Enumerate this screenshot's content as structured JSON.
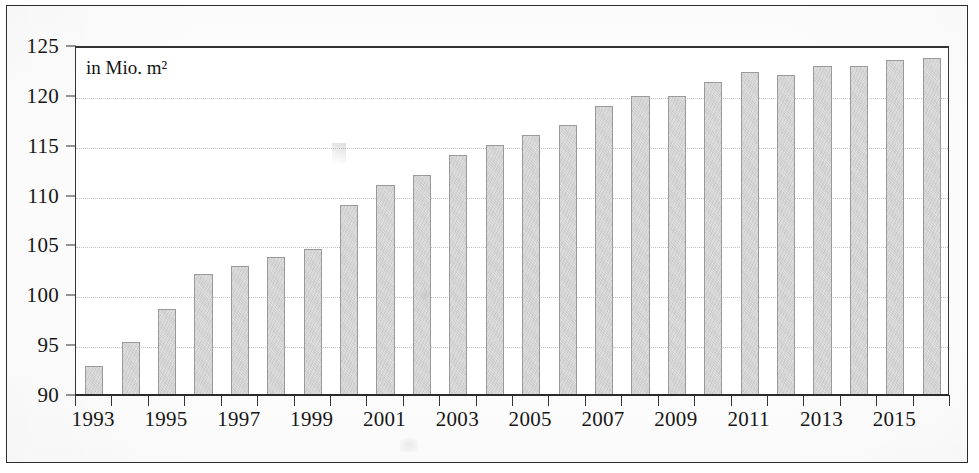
{
  "chart_data": {
    "type": "bar",
    "title": "",
    "subtitle": "",
    "unit_annotation": "in Mio. m²",
    "xlabel": "",
    "ylabel": "",
    "ylim": [
      90,
      125
    ],
    "y_ticks": [
      90,
      95,
      100,
      105,
      110,
      115,
      120,
      125
    ],
    "y_tick_labels": [
      "90",
      "95",
      "100",
      "105",
      "110",
      "115",
      "120",
      "125"
    ],
    "grid": true,
    "grid_axis": "y",
    "legend": null,
    "legend_position": "none",
    "categories": [
      "1993",
      "1994",
      "1995",
      "1996",
      "1997",
      "1998",
      "1999",
      "2000",
      "2001",
      "2002",
      "2003",
      "2004",
      "2005",
      "2006",
      "2007",
      "2008",
      "2009",
      "2010",
      "2011",
      "2012",
      "2013",
      "2014",
      "2015",
      "2016"
    ],
    "x_tick_labels_shown": [
      "1993",
      "1995",
      "1997",
      "1999",
      "2001",
      "2003",
      "2005",
      "2007",
      "2009",
      "2011",
      "2013",
      "2015"
    ],
    "values": [
      92.8,
      95.2,
      98.5,
      102.0,
      102.8,
      103.7,
      104.5,
      109.0,
      111.0,
      112.0,
      114.0,
      115.0,
      116.0,
      117.0,
      118.9,
      119.9,
      119.9,
      121.3,
      122.3,
      122.0,
      122.9,
      122.9,
      123.5,
      123.7
    ],
    "bar_fill_color": "#dedede",
    "bar_border_color": "#9a9a9a",
    "gridline_color": "#c2c2c2",
    "axis_color": "#2b2b2b",
    "text_color": "#161616"
  },
  "figure": {
    "border_color": "#2b2b2b",
    "background_color": "#ffffff"
  }
}
